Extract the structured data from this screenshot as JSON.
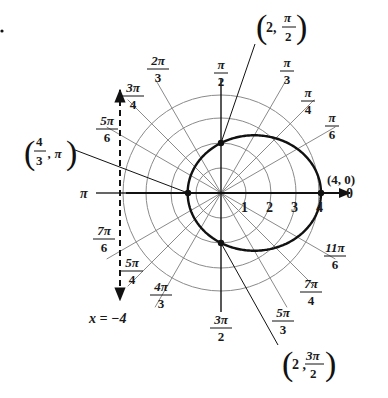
{
  "figure": {
    "marker_dot": "•",
    "equation_curve": "r = 4/(2 - cos θ)",
    "directrix_label": "x = −4",
    "pole_axis_label": "0",
    "pi_label": "π",
    "radial_ticks": [
      "1",
      "2",
      "3",
      "4"
    ],
    "angle_labels": [
      {
        "num": "π",
        "den": "2",
        "angle_deg": 90
      },
      {
        "num": "π",
        "den": "3",
        "angle_deg": 60
      },
      {
        "num": "π",
        "den": "4",
        "angle_deg": 45
      },
      {
        "num": "π",
        "den": "6",
        "angle_deg": 30
      },
      {
        "num": "2π",
        "den": "3",
        "angle_deg": 120
      },
      {
        "num": "3π",
        "den": "4",
        "angle_deg": 135
      },
      {
        "num": "5π",
        "den": "6",
        "angle_deg": 150
      },
      {
        "num": "7π",
        "den": "6",
        "angle_deg": 210
      },
      {
        "num": "5π",
        "den": "4",
        "angle_deg": 225
      },
      {
        "num": "4π",
        "den": "3",
        "angle_deg": 240
      },
      {
        "num": "3π",
        "den": "2",
        "angle_deg": 270
      },
      {
        "num": "5π",
        "den": "3",
        "angle_deg": 300
      },
      {
        "num": "7π",
        "den": "4",
        "angle_deg": 315
      },
      {
        "num": "11π",
        "den": "6",
        "angle_deg": 330
      }
    ],
    "points": [
      {
        "label": "(4, 0)",
        "r": 4,
        "theta": "0"
      },
      {
        "label_r": "2,",
        "label_num": "π",
        "label_den": "2",
        "r": 2,
        "theta": "π/2"
      },
      {
        "label_num_r": "4",
        "label_den_r": "3",
        "label_theta": ", π",
        "r": 1.3333,
        "theta": "π"
      },
      {
        "label_r": "2 ,",
        "label_num": "3π",
        "label_den": "2",
        "r": 2,
        "theta": "3π/2"
      }
    ],
    "colors": {
      "curve": "#111111",
      "grid": "#8a8a8a",
      "axis": "#111111",
      "text": "#1a1a1a"
    }
  }
}
